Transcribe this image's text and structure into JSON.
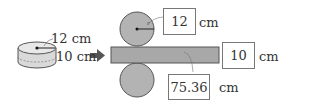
{
  "cylinder": {
    "radius_label": "12 cm",
    "height_label": "10 cm"
  },
  "roller": {
    "radius_symbol": "r"
  },
  "answers": {
    "radius_value": "12",
    "radius_unit": "cm",
    "thickness_value": "10",
    "thickness_unit": "cm",
    "length_value": "75.36",
    "length_unit": "cm"
  },
  "colors": {
    "roller_fill": "#b3b3b3",
    "sheet_fill": "#a8a8a8",
    "outline": "#555555",
    "arrow": "#555555"
  }
}
